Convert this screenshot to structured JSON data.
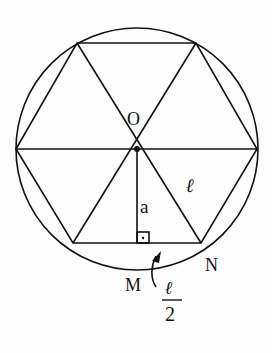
{
  "diagram": {
    "stroke_color": "#111111",
    "labels": {
      "center": "O",
      "apothem": "a",
      "side": "ℓ",
      "point_m": "M",
      "point_n": "N",
      "half_side_numerator": "ℓ",
      "half_side_denominator": "2"
    },
    "geometry": {
      "circle": {
        "cx": 137,
        "cy": 149,
        "r": 121
      },
      "hexagon_vertices": [
        [
          16,
          149
        ],
        [
          77,
          43
        ],
        [
          196,
          43
        ],
        [
          257,
          149
        ],
        [
          201,
          243
        ],
        [
          73,
          243
        ]
      ],
      "center": [
        137,
        149
      ],
      "apothem_foot": [
        137,
        243
      ]
    }
  }
}
